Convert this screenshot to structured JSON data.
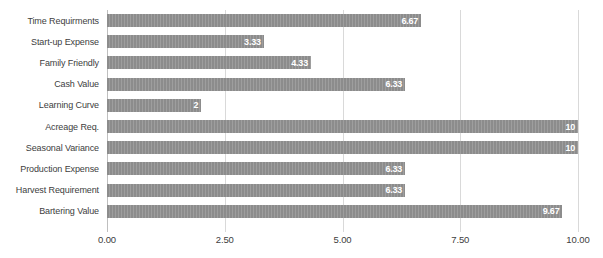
{
  "chart_data": {
    "type": "bar",
    "orientation": "horizontal",
    "title": "",
    "subtitle": "",
    "xlabel": "",
    "ylabel": "",
    "xlim": [
      0,
      10
    ],
    "xticks": [
      0,
      2.5,
      5,
      7.5,
      10
    ],
    "xtick_labels": [
      "0.00",
      "2.50",
      "5.00",
      "7.50",
      "10.00"
    ],
    "grid": true,
    "legend": false,
    "legend_position": "none",
    "categories": [
      "Time Requirments",
      "Start-up Expense",
      "Family Friendly",
      "Cash Value",
      "Learning Curve",
      "Acreage Req.",
      "Seasonal Variance",
      "Production Expense",
      "Harvest Requirement",
      "Bartering Value"
    ],
    "values": [
      6.67,
      3.33,
      4.33,
      6.33,
      2,
      10,
      10,
      6.33,
      6.33,
      9.67
    ],
    "value_labels": [
      "6.67",
      "3.33",
      "4.33",
      "6.33",
      "2",
      "10",
      "10",
      "6.33",
      "6.33",
      "9.67"
    ],
    "colors": {
      "bar": "#8c8c8c",
      "bar_label_text": "#ffffff",
      "gridline": "#d9d9d9",
      "axis_line": "#bfbfbf",
      "tick_text": "#404040",
      "background": "#ffffff"
    }
  }
}
